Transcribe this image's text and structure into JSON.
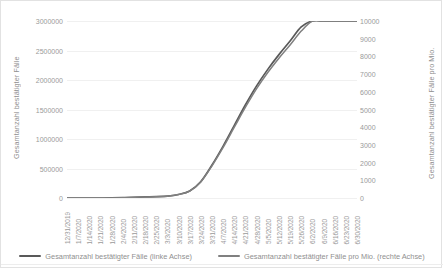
{
  "chart_data": {
    "type": "line",
    "title": "",
    "xlabel": "",
    "ylabel": "Gesamtanzahl bestätigter Fälle",
    "y2label": "Gesamtanzahl bestätigter Fälle pro Mio.",
    "grid": true,
    "legend_position": "bottom",
    "ylim": [
      0,
      3000000
    ],
    "y2lim": [
      0,
      10000
    ],
    "yticks": [
      "0",
      "500000",
      "1000000",
      "1500000",
      "2000000",
      "2500000",
      "3000000"
    ],
    "ytick_values": [
      0,
      500000,
      1000000,
      1500000,
      2000000,
      2500000,
      3000000
    ],
    "y2ticks": [
      "0",
      "1000",
      "2000",
      "3000",
      "4000",
      "5000",
      "6000",
      "7000",
      "8000",
      "9000",
      "10000"
    ],
    "y2tick_values": [
      0,
      1000,
      2000,
      3000,
      4000,
      5000,
      6000,
      7000,
      8000,
      9000,
      10000
    ],
    "categories": [
      "12/31/2019",
      "1/7/2020",
      "1/14/2020",
      "1/21/2020",
      "1/28/2020",
      "2/4/2020",
      "2/11/2020",
      "2/18/2020",
      "2/25/2020",
      "3/3/2020",
      "3/10/2020",
      "3/17/2020",
      "3/24/2020",
      "3/31/2020",
      "4/7/2020",
      "4/14/2020",
      "4/21/2020",
      "4/28/2020",
      "5/5/2020",
      "5/12/2020",
      "5/19/2020",
      "5/26/2020",
      "6/2/2020",
      "6/9/2020",
      "6/16/2020",
      "6/23/2020",
      "6/30/2020"
    ],
    "series": [
      {
        "name": "Gesamtanzahl bestätigter Fälle (linke Achse)",
        "axis": "left",
        "color": "#595959",
        "values": [
          0,
          0,
          0,
          0,
          1000,
          5000,
          12000,
          18000,
          23000,
          32000,
          60000,
          120000,
          280000,
          560000,
          880000,
          1230000,
          1580000,
          1900000,
          2180000,
          2430000,
          2660000,
          2900000,
          3150000,
          3420000,
          3700000,
          4050000,
          4400000
        ]
      },
      {
        "name": "Gesamtanzahl bestätigter Fälle pro Mio. (rechte Achse)",
        "axis": "right",
        "color": "#808080",
        "values": [
          0,
          0,
          0,
          0,
          3,
          16,
          40,
          58,
          75,
          105,
          195,
          390,
          910,
          1820,
          2860,
          4000,
          5130,
          6180,
          7090,
          7900,
          8650,
          9430,
          10250,
          11120,
          12030,
          13170,
          14300
        ]
      }
    ],
    "legend": [
      {
        "label": "Gesamtanzahl bestätigter Fälle (linke Achse)",
        "color": "#595959"
      },
      {
        "label": "Gesamtanzahl bestätigter Fälle pro Mio. (rechte Achse)",
        "color": "#808080"
      }
    ]
  }
}
